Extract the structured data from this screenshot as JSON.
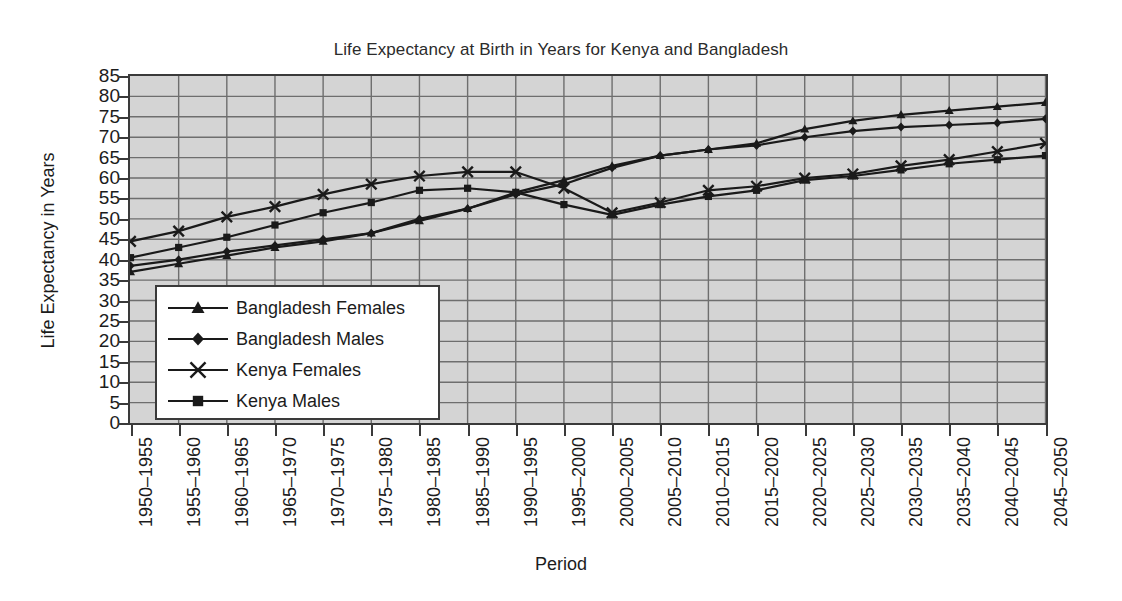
{
  "chart_data": {
    "type": "line",
    "title": "Life Expectancy at Birth in Years for Kenya and Bangladesh",
    "xlabel": "Period",
    "ylabel": "Life Expectancy in Years",
    "ylim": [
      0,
      85
    ],
    "ytick_step": 5,
    "yticks": [
      0,
      5,
      10,
      15,
      20,
      25,
      30,
      35,
      40,
      45,
      50,
      55,
      60,
      65,
      70,
      75,
      80,
      85
    ],
    "ytick_labels": [
      "0",
      "5",
      "10",
      "15",
      "20",
      "25",
      "30",
      "35",
      "40",
      "45",
      "50",
      "55",
      "60",
      "65",
      "70",
      "75",
      "80",
      "85"
    ],
    "grid": true,
    "grid_color": "#6e6e6e",
    "plot_background": "#d4d4d4",
    "legend_position": "inside-lower-left",
    "categories": [
      "1950–1955",
      "1955–1960",
      "1960–1965",
      "1965–1970",
      "1970–1975",
      "1975–1980",
      "1980–1985",
      "1985–1990",
      "1990–1995",
      "1995–2000",
      "2000–2005",
      "2005–2010",
      "2010–2015",
      "2015–2020",
      "2020–2025",
      "2025–2030",
      "2030–2035",
      "2035–2040",
      "2040–2045",
      "2045–2050"
    ],
    "series": [
      {
        "name": "Bangladesh Females",
        "marker": "triangle",
        "color": "#1a1a1a",
        "values": [
          37.0,
          39.0,
          41.0,
          43.0,
          44.5,
          46.5,
          49.5,
          52.5,
          56.5,
          59.5,
          63.0,
          65.5,
          67.0,
          68.5,
          72.0,
          74.0,
          75.5,
          76.5,
          77.5,
          78.5
        ]
      },
      {
        "name": "Bangladesh Males",
        "marker": "diamond",
        "color": "#1a1a1a",
        "values": [
          38.5,
          40.0,
          42.0,
          43.5,
          45.0,
          46.5,
          50.0,
          52.5,
          56.0,
          58.5,
          62.5,
          65.5,
          67.0,
          68.0,
          70.0,
          71.5,
          72.5,
          73.0,
          73.5,
          74.5
        ]
      },
      {
        "name": "Kenya Females",
        "marker": "cross",
        "color": "#1a1a1a",
        "values": [
          44.5,
          47.0,
          50.5,
          53.0,
          56.0,
          58.5,
          60.5,
          61.5,
          61.5,
          57.5,
          51.5,
          54.0,
          57.0,
          58.0,
          60.0,
          61.0,
          63.0,
          64.5,
          66.5,
          68.5
        ]
      },
      {
        "name": "Kenya Males",
        "marker": "square",
        "color": "#1a1a1a",
        "values": [
          40.5,
          43.0,
          45.5,
          48.5,
          51.5,
          54.0,
          57.0,
          57.5,
          56.5,
          53.5,
          51.0,
          53.5,
          55.5,
          57.0,
          59.5,
          60.5,
          62.0,
          63.5,
          64.5,
          65.5
        ]
      }
    ]
  },
  "legend": {
    "items": [
      {
        "label": "Bangladesh Females",
        "marker": "triangle"
      },
      {
        "label": "Bangladesh Males",
        "marker": "diamond"
      },
      {
        "label": "Kenya Females",
        "marker": "cross"
      },
      {
        "label": "Kenya Males",
        "marker": "square"
      }
    ]
  }
}
